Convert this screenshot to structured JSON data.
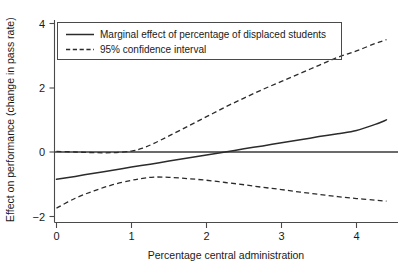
{
  "chart_data": {
    "type": "line",
    "title": "",
    "xlabel": "Percentage central administration",
    "ylabel": "Effect on performance (change in pass rate)",
    "xlim": [
      -0.06,
      4.55
    ],
    "ylim": [
      -2.35,
      4.35
    ],
    "xticks": [
      0,
      1,
      2,
      3,
      4
    ],
    "xtick_labels": [
      "0",
      "1",
      "2",
      "3",
      "4"
    ],
    "yticks": [
      -2,
      0,
      2,
      4
    ],
    "ytick_labels": [
      "−2",
      "0",
      "2",
      "4"
    ],
    "grid": false,
    "legend_position": "upper left",
    "reference_lines": [
      {
        "name": "zero-reference",
        "orientation": "horizontal",
        "value": 0,
        "style": "solid"
      }
    ],
    "series": [
      {
        "name": "Marginal effect of percentage of displaced students",
        "style": "solid",
        "color": "#2b2b2b",
        "x": [
          0,
          0.25,
          0.5,
          0.75,
          1,
          1.25,
          1.5,
          1.75,
          2,
          2.25,
          2.5,
          2.75,
          3,
          3.25,
          3.5,
          3.75,
          4,
          4.25,
          4.4
        ],
        "y": [
          -0.85,
          -0.76,
          -0.66,
          -0.57,
          -0.47,
          -0.38,
          -0.28,
          -0.19,
          -0.09,
          0.0,
          0.1,
          0.19,
          0.29,
          0.38,
          0.48,
          0.57,
          0.67,
          0.86,
          1.0
        ]
      },
      {
        "name": "95% confidence interval upper bound",
        "style": "dashed",
        "color": "#2b2b2b",
        "x": [
          0,
          0.25,
          0.5,
          0.75,
          1,
          1.15,
          1.3,
          1.5,
          1.75,
          2,
          2.25,
          2.5,
          2.75,
          3,
          3.25,
          3.5,
          3.75,
          4,
          4.25,
          4.4
        ],
        "y": [
          0.02,
          0.0,
          -0.02,
          -0.02,
          0.03,
          0.12,
          0.27,
          0.5,
          0.8,
          1.1,
          1.4,
          1.68,
          1.95,
          2.2,
          2.45,
          2.7,
          2.95,
          3.15,
          3.38,
          3.5
        ]
      },
      {
        "name": "95% confidence interval lower bound",
        "style": "dashed",
        "color": "#2b2b2b",
        "x": [
          0,
          0.25,
          0.5,
          0.75,
          1,
          1.15,
          1.3,
          1.5,
          1.75,
          2,
          2.25,
          2.5,
          2.75,
          3,
          3.25,
          3.5,
          3.75,
          4,
          4.25,
          4.4
        ],
        "y": [
          -1.75,
          -1.44,
          -1.21,
          -1.02,
          -0.88,
          -0.82,
          -0.78,
          -0.79,
          -0.83,
          -0.88,
          -0.95,
          -1.02,
          -1.1,
          -1.17,
          -1.25,
          -1.32,
          -1.39,
          -1.45,
          -1.5,
          -1.53
        ]
      }
    ],
    "legend_entries": [
      {
        "label": "Marginal effect of percentage of displaced students",
        "style": "solid"
      },
      {
        "label": "95% confidence interval",
        "style": "dashed"
      }
    ]
  }
}
